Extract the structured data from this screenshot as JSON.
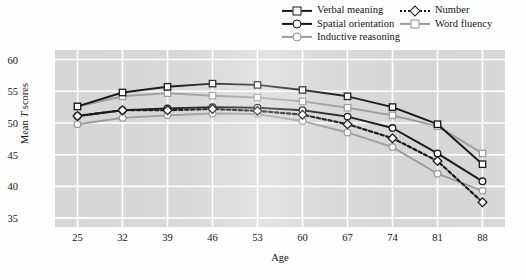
{
  "chart_data": {
    "type": "line",
    "title": "",
    "xlabel": "Age",
    "ylabel": "Mean T scores",
    "x": [
      25,
      32,
      39,
      46,
      53,
      60,
      67,
      74,
      81,
      88
    ],
    "xlim": [
      21.5,
      91.5
    ],
    "ylim": [
      33.6,
      61.5
    ],
    "yticks": [
      35,
      40,
      45,
      50,
      55,
      60
    ],
    "grid": true,
    "legend_position": "top-right",
    "series": [
      {
        "name": "Verbal meaning",
        "marker": "square",
        "line": "solid",
        "color": "#151515",
        "values": [
          52.6,
          54.8,
          55.7,
          56.2,
          56.0,
          55.2,
          54.2,
          52.5,
          49.8,
          43.5
        ]
      },
      {
        "name": "Spatial orientation",
        "marker": "circle",
        "line": "solid",
        "color": "#151515",
        "values": [
          51.1,
          52.0,
          52.3,
          52.5,
          52.4,
          52.0,
          51.0,
          49.2,
          45.2,
          40.8
        ]
      },
      {
        "name": "Inductive reasoning",
        "marker": "circle",
        "line": "solid",
        "color": "#9a9a9a",
        "values": [
          49.8,
          50.8,
          51.2,
          51.5,
          51.4,
          50.3,
          48.5,
          46.2,
          42.0,
          39.3
        ]
      },
      {
        "name": "Number",
        "marker": "diamond",
        "line": "dotted",
        "color": "#151515",
        "values": [
          51.1,
          52.0,
          52.0,
          52.2,
          51.9,
          51.3,
          49.8,
          47.6,
          44.0,
          37.5
        ]
      },
      {
        "name": "Word fluency",
        "marker": "square",
        "line": "solid",
        "color": "#9a9a9a",
        "values": [
          52.6,
          54.2,
          54.7,
          54.3,
          54.0,
          53.4,
          52.4,
          51.2,
          49.5,
          45.2
        ]
      }
    ]
  },
  "legend": {
    "columns": [
      {
        "items": [
          {
            "label": "Verbal meaning",
            "key": "square-dark-solid"
          },
          {
            "label": "Spatial orientation",
            "key": "circle-dark-solid"
          },
          {
            "label": "Inductive reasoning",
            "key": "circle-gray-solid"
          }
        ]
      },
      {
        "items": [
          {
            "label": "Number",
            "key": "diamond-dark-dotted"
          },
          {
            "label": "Word fluency",
            "key": "square-gray-solid"
          }
        ]
      }
    ]
  },
  "axes": {
    "y_title_prefix": "Mean ",
    "y_title_italic": "T",
    "y_title_suffix": " scores",
    "x_title": "Age",
    "y_ticks": [
      "60",
      "55",
      "50",
      "45",
      "40",
      "35"
    ],
    "x_ticks": [
      "25",
      "32",
      "39",
      "46",
      "53",
      "60",
      "67",
      "74",
      "81",
      "88"
    ]
  },
  "colors": {
    "plot_background": "#d6d6d6",
    "gridline": "#ffffff",
    "dark_series": "#151515",
    "gray_series": "#9a9a9a",
    "marker_fill": "#ffffff"
  }
}
